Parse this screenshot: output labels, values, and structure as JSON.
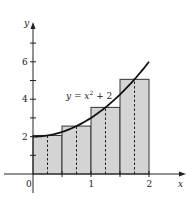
{
  "chart_data": {
    "type": "diagram",
    "function_label": "y = x² + 2",
    "function_label_parts": {
      "lhs": "y = x",
      "exp": "2",
      "rhs": " + 2"
    },
    "xlabel": "x",
    "ylabel": "y",
    "origin_label": "0",
    "xlim": [
      0,
      2.2
    ],
    "ylim": [
      0,
      7.5
    ],
    "x_ticks": [
      0.5,
      1,
      1.5,
      2
    ],
    "x_tick_labels": [
      {
        "value": 1,
        "label": "1"
      },
      {
        "value": 2,
        "label": "2"
      }
    ],
    "y_ticks": [
      1,
      2,
      3,
      4,
      5,
      6,
      7
    ],
    "y_tick_labels": [
      {
        "value": 2,
        "label": "2"
      },
      {
        "value": 4,
        "label": "4"
      },
      {
        "value": 6,
        "label": "6"
      }
    ],
    "rectangles": [
      {
        "x_start": 0.0,
        "x_end": 0.5,
        "midpoint": 0.25,
        "height": 2.0625
      },
      {
        "x_start": 0.5,
        "x_end": 1.0,
        "midpoint": 0.75,
        "height": 2.5625
      },
      {
        "x_start": 1.0,
        "x_end": 1.5,
        "midpoint": 1.25,
        "height": 3.5625
      },
      {
        "x_start": 1.5,
        "x_end": 2.0,
        "midpoint": 1.75,
        "height": 5.0625
      }
    ],
    "curve": {
      "expr": "x^2 + 2",
      "x_range": [
        0,
        2
      ]
    },
    "colors": {
      "rect_fill": "#d4d4d4",
      "line": "#111111"
    }
  }
}
